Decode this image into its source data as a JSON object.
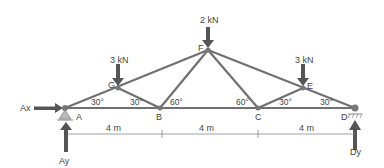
{
  "diagram": {
    "nodes": {
      "A": "A",
      "B": "B",
      "C": "C",
      "D": "D",
      "E": "E",
      "F": "F",
      "G": "G"
    },
    "loads": {
      "G": "3 kN",
      "F": "2 kN",
      "E": "3 kN"
    },
    "reactions": {
      "Ax": "Ax",
      "Ay": "Ay",
      "Dy": "Dy"
    },
    "angles": {
      "A_GA": "30°",
      "B_GB": "30°",
      "B_FB": "60°",
      "C_FC": "60°",
      "C_EC": "30°",
      "D_ED": "30°"
    },
    "dimensions": [
      "4 m",
      "4 m",
      "4 m"
    ],
    "colors": {
      "member": "#6b6b6b",
      "arrow": "#555555",
      "text": "#444444"
    }
  }
}
